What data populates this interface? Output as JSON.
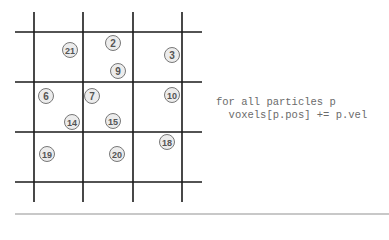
{
  "grid": {
    "vertical_lines_x": [
      34,
      83,
      133,
      182
    ],
    "horizontal_lines_y": [
      32,
      82,
      132,
      182
    ],
    "line_color": "#1a1a1a",
    "extent": {
      "x1": 15,
      "x2": 202,
      "y1": 12,
      "y2": 202
    }
  },
  "particles": [
    {
      "id": "21",
      "x": 70,
      "y": 50
    },
    {
      "id": "2",
      "x": 113,
      "y": 43
    },
    {
      "id": "3",
      "x": 172,
      "y": 55
    },
    {
      "id": "9",
      "x": 118,
      "y": 71
    },
    {
      "id": "6",
      "x": 46,
      "y": 96
    },
    {
      "id": "7",
      "x": 92,
      "y": 96
    },
    {
      "id": "10",
      "x": 172,
      "y": 95
    },
    {
      "id": "14",
      "x": 72,
      "y": 122
    },
    {
      "id": "15",
      "x": 113,
      "y": 121
    },
    {
      "id": "18",
      "x": 167,
      "y": 142
    },
    {
      "id": "19",
      "x": 47,
      "y": 154
    },
    {
      "id": "20",
      "x": 117,
      "y": 154
    }
  ],
  "code": {
    "line1": "for all particles p",
    "line2": "  voxels[p.pos] += p.vel"
  },
  "colors": {
    "particle_fill": "#ececec",
    "particle_stroke": "#777777",
    "particle_text": "#555555"
  }
}
